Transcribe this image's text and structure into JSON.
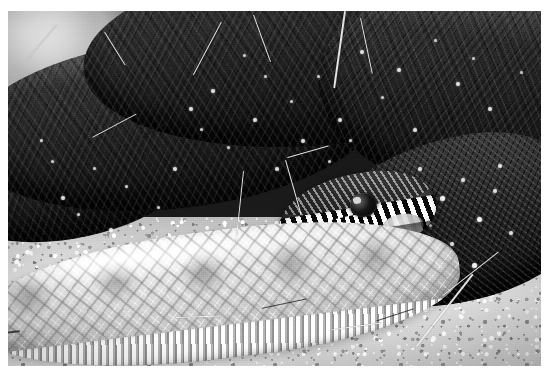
{
  "image": {
    "kind": "photograph",
    "medium": "black-and-white photographic print",
    "subject": "rattlesnake",
    "alt_text": "Black-and-white photograph of a coiled rattlesnake resting on sandy gravel ground. A dark, heavily scaled coil fills the upper half of the frame while a pale, diamond-patterned section of the body lies across the foreground. The snake's head, marked with bold black-and-white bars, rests at the center right."
  },
  "border": {
    "color": "#ffffff",
    "left_px": 8,
    "top_px": 11,
    "right_px": 13,
    "bottom_px": 19
  },
  "canvas": {
    "width_px": 554,
    "height_px": 385,
    "photo_width_px": 533,
    "photo_height_px": 355
  },
  "palette": {
    "highlight": "#fbfbfb",
    "light_body": "#d5d5d5",
    "midtone": "#8f8f8f",
    "shadow": "#3a3a3a",
    "deep_shadow": "#141414",
    "sand": "#d2d2d2",
    "paper": "#ffffff"
  },
  "regions": [
    {
      "name": "background-blur",
      "label": "Blurred pale background, upper left",
      "tone": "light"
    },
    {
      "name": "dark-coil-upper",
      "label": "Dark coiled body of the snake, upper frame",
      "tone": "dark",
      "detail": "keeled scales with scattered light speckle clusters"
    },
    {
      "name": "snake-head",
      "label": "Snake head with eye and banded labial scales",
      "tone": "high contrast"
    },
    {
      "name": "neck-right",
      "label": "Dark neck and body to the right of the head",
      "tone": "dark",
      "detail": "bright white scale spots"
    },
    {
      "name": "foreground-body",
      "label": "Pale diamond-patterned body across the foreground",
      "tone": "light"
    },
    {
      "name": "ground",
      "label": "Sandy gravel ground",
      "tone": "light"
    },
    {
      "name": "grass-stems",
      "label": "Dry grass stems crossing the frame",
      "tone": "light"
    }
  ],
  "speckles": [
    {
      "x": 10,
      "y": 52,
      "s": 4
    },
    {
      "x": 13,
      "y": 57,
      "s": 3
    },
    {
      "x": 16,
      "y": 44,
      "s": 3
    },
    {
      "x": 19,
      "y": 61,
      "s": 4
    },
    {
      "x": 22,
      "y": 49,
      "s": 3
    },
    {
      "x": 25,
      "y": 66,
      "s": 4
    },
    {
      "x": 28,
      "y": 55,
      "s": 3
    },
    {
      "x": 31,
      "y": 44,
      "s": 4
    },
    {
      "x": 34,
      "y": 27,
      "s": 4
    },
    {
      "x": 36,
      "y": 33,
      "s": 3
    },
    {
      "x": 38,
      "y": 22,
      "s": 4
    },
    {
      "x": 41,
      "y": 38,
      "s": 3
    },
    {
      "x": 46,
      "y": 30,
      "s": 4
    },
    {
      "x": 50,
      "y": 44,
      "s": 4
    },
    {
      "x": 53,
      "y": 25,
      "s": 3
    },
    {
      "x": 55,
      "y": 36,
      "s": 4
    },
    {
      "x": 58,
      "y": 18,
      "s": 3
    },
    {
      "x": 62,
      "y": 30,
      "s": 4
    },
    {
      "x": 66,
      "y": 11,
      "s": 4
    },
    {
      "x": 70,
      "y": 24,
      "s": 3
    },
    {
      "x": 73,
      "y": 16,
      "s": 4
    },
    {
      "x": 76,
      "y": 33,
      "s": 4
    },
    {
      "x": 80,
      "y": 8,
      "s": 3
    },
    {
      "x": 84,
      "y": 20,
      "s": 4
    },
    {
      "x": 87,
      "y": 13,
      "s": 3
    },
    {
      "x": 90,
      "y": 27,
      "s": 4
    },
    {
      "x": 93,
      "y": 36,
      "s": 4
    },
    {
      "x": 96,
      "y": 17,
      "s": 3
    },
    {
      "x": 77,
      "y": 44,
      "s": 4
    },
    {
      "x": 81,
      "y": 52,
      "s": 5
    },
    {
      "x": 85,
      "y": 47,
      "s": 4
    },
    {
      "x": 88,
      "y": 58,
      "s": 5
    },
    {
      "x": 91,
      "y": 50,
      "s": 4
    },
    {
      "x": 94,
      "y": 62,
      "s": 4
    },
    {
      "x": 83,
      "y": 65,
      "s": 4
    },
    {
      "x": 87,
      "y": 71,
      "s": 5
    },
    {
      "x": 79,
      "y": 60,
      "s": 3
    },
    {
      "x": 92,
      "y": 43,
      "s": 4
    },
    {
      "x": 6,
      "y": 36,
      "s": 3
    },
    {
      "x": 8,
      "y": 42,
      "s": 3
    },
    {
      "x": 44,
      "y": 12,
      "s": 3
    },
    {
      "x": 48,
      "y": 18,
      "s": 3
    },
    {
      "x": 60,
      "y": 42,
      "s": 3
    },
    {
      "x": 64,
      "y": 36,
      "s": 3
    }
  ],
  "stems": [
    {
      "x": 40,
      "y": 3,
      "w": 1.4,
      "h": 17,
      "rot": 28
    },
    {
      "x": 46,
      "y": 1,
      "w": 1.2,
      "h": 14,
      "rot": -20
    },
    {
      "x": 63,
      "y": 0,
      "w": 1.6,
      "h": 22,
      "rot": 8
    },
    {
      "x": 66,
      "y": 2,
      "w": 1.2,
      "h": 16,
      "rot": -12
    },
    {
      "x": 9,
      "y": 4,
      "w": 1.3,
      "h": 13,
      "rot": 40
    },
    {
      "x": 18,
      "y": 6,
      "w": 1.1,
      "h": 11,
      "rot": -32
    },
    {
      "x": 44,
      "y": 45,
      "w": 1.3,
      "h": 22,
      "rot": 6
    },
    {
      "x": 52,
      "y": 42,
      "w": 1.1,
      "h": 16,
      "rot": -16
    },
    {
      "x": 60,
      "y": 38,
      "w": 1.4,
      "h": 12,
      "rot": 74
    },
    {
      "x": 87,
      "y": 74,
      "w": 1.5,
      "h": 26,
      "rot": 38
    },
    {
      "x": 92,
      "y": 68,
      "w": 1.3,
      "h": 20,
      "rot": 52
    },
    {
      "x": 70,
      "y": 88,
      "w": 1.2,
      "h": 14,
      "rot": 82
    },
    {
      "x": 40,
      "y": 86,
      "w": 1.2,
      "h": 13,
      "rot": 88
    },
    {
      "x": 24,
      "y": 29,
      "w": 1.2,
      "h": 14,
      "rot": 62
    }
  ],
  "stems_dark": [
    {
      "x": 2,
      "y": 90,
      "w": 1.6,
      "h": 10,
      "rot": 84
    },
    {
      "x": 56,
      "y": 81,
      "w": 1.4,
      "h": 13,
      "rot": 78
    },
    {
      "x": 76,
      "y": 84,
      "w": 1.3,
      "h": 11,
      "rot": 72
    },
    {
      "x": 30,
      "y": 31,
      "w": 1.5,
      "h": 9,
      "rot": 58
    }
  ]
}
